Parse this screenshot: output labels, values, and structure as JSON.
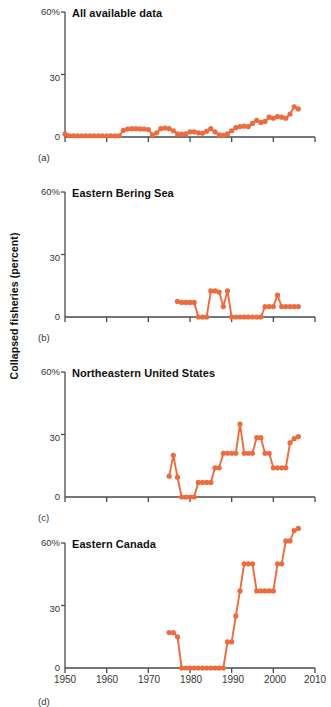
{
  "figure": {
    "y_axis_label": "Collapsed fisheries (percent)",
    "accent_color": "#EC6C3F",
    "axis_color": "#4a4a4a",
    "x_ticks": [
      "1950",
      "1960",
      "1970",
      "1980",
      "1990",
      "2000",
      "2010"
    ],
    "y_ticks": [
      "0",
      "30",
      "60%"
    ],
    "panel_labels": [
      "(a)",
      "(b)",
      "(c)",
      "(d)"
    ]
  },
  "chart_data": [
    {
      "type": "line",
      "title": "All available data",
      "panel": "(a)",
      "xlabel": "",
      "ylabel": "Collapsed fisheries (percent)",
      "xlim": [
        1950,
        2010
      ],
      "ylim": [
        0,
        60
      ],
      "grid": false,
      "legend": "none",
      "marker": "circle",
      "color": "#EC6C3F",
      "x": [
        1950,
        1951,
        1952,
        1953,
        1954,
        1955,
        1956,
        1957,
        1958,
        1959,
        1960,
        1961,
        1962,
        1963,
        1964,
        1965,
        1966,
        1967,
        1968,
        1969,
        1970,
        1971,
        1972,
        1973,
        1974,
        1975,
        1976,
        1977,
        1978,
        1979,
        1980,
        1981,
        1982,
        1983,
        1984,
        1985,
        1986,
        1987,
        1988,
        1989,
        1990,
        1991,
        1992,
        1993,
        1994,
        1995,
        1996,
        1997,
        1998,
        1999,
        2000,
        2001,
        2002,
        2003,
        2004,
        2005,
        2006
      ],
      "y": [
        1.5,
        0.6,
        0.6,
        0.6,
        0.6,
        0.6,
        0.6,
        0.6,
        0.6,
        0.6,
        0.6,
        0.6,
        0.6,
        0.6,
        3.2,
        3.8,
        4.0,
        4.0,
        3.9,
        3.8,
        3.6,
        1.0,
        2.0,
        4.0,
        4.3,
        4.0,
        3.0,
        1.5,
        1.4,
        1.5,
        2.5,
        2.5,
        2.0,
        1.8,
        2.8,
        4.0,
        2.5,
        1.0,
        0.8,
        1.5,
        3.0,
        4.5,
        5.0,
        5.2,
        5.0,
        6.5,
        8.0,
        7.0,
        7.5,
        9.5,
        9.0,
        9.8,
        9.5,
        9.0,
        11.0,
        14.5,
        13.5
      ]
    },
    {
      "type": "line",
      "title": "Eastern Bering Sea",
      "panel": "(b)",
      "xlabel": "",
      "ylabel": "Collapsed fisheries (percent)",
      "xlim": [
        1950,
        2010
      ],
      "ylim": [
        0,
        60
      ],
      "grid": false,
      "legend": "none",
      "marker": "circle",
      "color": "#EC6C3F",
      "x": [
        1977,
        1978,
        1979,
        1980,
        1981,
        1982,
        1983,
        1984,
        1985,
        1986,
        1987,
        1988,
        1989,
        1990,
        1991,
        1992,
        1993,
        1994,
        1995,
        1996,
        1997,
        1998,
        1999,
        2000,
        2001,
        2002,
        2003,
        2004,
        2005,
        2006
      ],
      "y": [
        7.5,
        7.0,
        7.0,
        7.0,
        7.0,
        0.0,
        0.0,
        0.0,
        12.5,
        12.5,
        12.0,
        5.0,
        12.5,
        0.0,
        0.0,
        0.0,
        0.0,
        0.0,
        0.0,
        0.0,
        0.0,
        5.0,
        5.0,
        5.0,
        10.5,
        5.0,
        5.0,
        5.0,
        5.0,
        5.0
      ]
    },
    {
      "type": "line",
      "title": "Northeastern United States",
      "panel": "(c)",
      "xlabel": "",
      "ylabel": "Collapsed fisheries (percent)",
      "xlim": [
        1950,
        2010
      ],
      "ylim": [
        0,
        60
      ],
      "grid": false,
      "legend": "none",
      "marker": "circle",
      "color": "#EC6C3F",
      "x": [
        1975,
        1976,
        1977,
        1978,
        1979,
        1980,
        1981,
        1982,
        1983,
        1984,
        1985,
        1986,
        1987,
        1988,
        1989,
        1990,
        1991,
        1992,
        1993,
        1994,
        1995,
        1996,
        1997,
        1998,
        1999,
        2000,
        2001,
        2002,
        2003,
        2004,
        2005,
        2006
      ],
      "y": [
        10.0,
        20.0,
        9.5,
        0.0,
        0.0,
        0.0,
        0.0,
        7.0,
        7.0,
        7.0,
        7.0,
        14.0,
        14.0,
        21.0,
        21.0,
        21.0,
        21.0,
        35.0,
        21.0,
        21.0,
        21.0,
        28.5,
        28.5,
        21.0,
        21.0,
        14.0,
        14.0,
        14.0,
        14.0,
        26.0,
        28.0,
        29.0
      ]
    },
    {
      "type": "line",
      "title": "Eastern Canada",
      "panel": "(d)",
      "xlabel": "",
      "ylabel": "Collapsed fisheries (percent)",
      "xlim": [
        1950,
        2010
      ],
      "ylim": [
        0,
        60
      ],
      "grid": false,
      "legend": "none",
      "marker": "circle",
      "color": "#EC6C3F",
      "x": [
        1975,
        1976,
        1977,
        1978,
        1979,
        1980,
        1981,
        1982,
        1983,
        1984,
        1985,
        1986,
        1987,
        1988,
        1989,
        1990,
        1991,
        1992,
        1993,
        1994,
        1995,
        1996,
        1997,
        1998,
        1999,
        2000,
        2001,
        2002,
        2003,
        2004,
        2005,
        2006
      ],
      "y": [
        17.0,
        17.0,
        15.0,
        0.0,
        0.0,
        0.0,
        0.0,
        0.0,
        0.0,
        0.0,
        0.0,
        0.0,
        0.0,
        0.0,
        12.5,
        12.5,
        25.0,
        37.0,
        50.0,
        50.0,
        50.0,
        37.0,
        37.0,
        37.0,
        37.0,
        37.0,
        50.0,
        50.0,
        61.0,
        61.0,
        66.0,
        67.0
      ]
    }
  ]
}
